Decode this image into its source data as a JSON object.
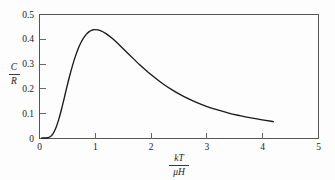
{
  "chart_data": {
    "type": "line",
    "title": "",
    "subtitle": "",
    "xlabel_numerator": "kT",
    "xlabel_denominator": "μH",
    "ylabel_numerator": "C",
    "ylabel_denominator": "R",
    "xlim": [
      0,
      5
    ],
    "ylim": [
      0,
      0.5
    ],
    "grid": false,
    "legend": null,
    "xticks": [
      0,
      1,
      2,
      3,
      4,
      5
    ],
    "xtick_labels": [
      "0",
      "1",
      "2",
      "3",
      "4",
      "5"
    ],
    "yticks": [
      0,
      0.1,
      0.2,
      0.3,
      0.4,
      0.5
    ],
    "ytick_labels": [
      "0",
      "0.1",
      "0.2",
      "0.3",
      "0.4",
      "0.5"
    ],
    "series": [
      {
        "name": "Schottky heat capacity",
        "x": [
          0.05,
          0.1,
          0.15,
          0.2,
          0.25,
          0.3,
          0.35,
          0.4,
          0.45,
          0.5,
          0.55,
          0.6,
          0.65,
          0.7,
          0.75,
          0.8,
          0.85,
          0.9,
          0.95,
          1.0,
          1.1,
          1.2,
          1.3,
          1.4,
          1.5,
          1.6,
          1.7,
          1.8,
          1.9,
          2.0,
          2.2,
          2.4,
          2.6,
          2.8,
          3.0,
          3.2,
          3.4,
          3.6,
          3.8,
          4.0,
          4.2
        ],
        "y": [
          0.0,
          0.0,
          0.001,
          0.005,
          0.017,
          0.039,
          0.072,
          0.113,
          0.159,
          0.206,
          0.251,
          0.292,
          0.328,
          0.359,
          0.384,
          0.404,
          0.419,
          0.429,
          0.435,
          0.437,
          0.433,
          0.421,
          0.404,
          0.384,
          0.362,
          0.34,
          0.318,
          0.296,
          0.276,
          0.257,
          0.222,
          0.192,
          0.167,
          0.146,
          0.128,
          0.113,
          0.1,
          0.09,
          0.081,
          0.073,
          0.066
        ],
        "color": "#1a1a1a"
      }
    ],
    "annotations": {
      "peak_value": 0.437,
      "peak_x": 0.95,
      "curve_start_x": 0.05,
      "curve_end_x": 4.2,
      "curve_end_y": 0.066
    }
  },
  "axes": {
    "plot_left_px": 39,
    "plot_right_px": 318,
    "plot_top_px": 14,
    "plot_bottom_px": 138
  },
  "colors": {
    "background": "#fdfdfd",
    "frame": "#555555",
    "curve": "#1a1a1a",
    "text": "#222222"
  }
}
